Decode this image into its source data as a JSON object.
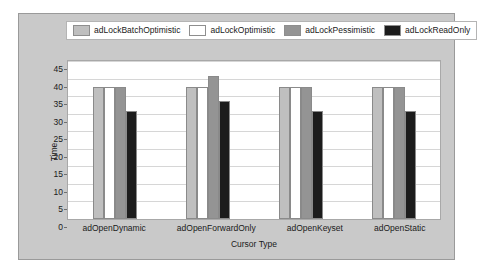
{
  "chart_data": {
    "type": "bar",
    "title": "",
    "xlabel": "Cursor Type",
    "ylabel": "Time",
    "ylim": [
      0,
      45
    ],
    "yticks": [
      45,
      40,
      35,
      30,
      25,
      20,
      15,
      10,
      5,
      0
    ],
    "grid": true,
    "legend_position": "top",
    "categories": [
      "adOpenDynamic",
      "adOpenForwardOnly",
      "adOpenKeyset",
      "adOpenStatic"
    ],
    "series": [
      {
        "name": "adLockBatchOptimistic",
        "color": "#bfbfbf",
        "values": [
          37.5,
          37.5,
          37.5,
          37.5
        ]
      },
      {
        "name": "adLockOptimistic",
        "color": "#ffffff",
        "values": [
          37.5,
          37.5,
          37.5,
          37.5
        ]
      },
      {
        "name": "adLockPessimistic",
        "color": "#949494",
        "values": [
          37.5,
          40.7,
          37.5,
          37.5
        ]
      },
      {
        "name": "adLockReadOnly",
        "color": "#1c1c1c",
        "values": [
          30.7,
          33.6,
          30.7,
          30.7
        ]
      }
    ]
  },
  "panel": {
    "background": "#c9c9c9",
    "border": "#9a9a9a",
    "plot_background": "#ffffff",
    "gridline_color": "#d6d6d6"
  }
}
